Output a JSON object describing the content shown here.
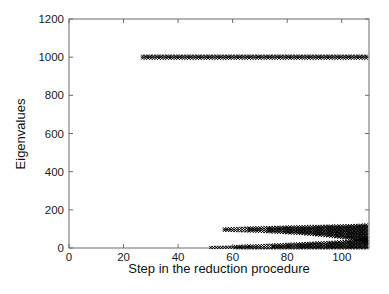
{
  "figure": {
    "background": "#ffffff",
    "frame_color": "#6b6b6b",
    "tick_label_color": "#1a1a1a",
    "marker_color": "#000000",
    "marker_glyph": "x"
  },
  "chart_data": {
    "type": "scatter",
    "title": "",
    "xlabel": "Step in the reduction procedure",
    "ylabel": "Eigenvalues",
    "xlim": [
      0,
      110
    ],
    "ylim": [
      0,
      1200
    ],
    "xticks": [
      0,
      20,
      40,
      60,
      80,
      100
    ],
    "yticks": [
      0,
      200,
      400,
      600,
      800,
      1000,
      1200
    ],
    "grid": false,
    "legend": null,
    "marker": "x",
    "series": [
      {
        "name": "cluster-near-1000",
        "step_start": 27,
        "step_end": 109,
        "band": [
          [
            27,
            995,
            1005
          ],
          [
            109,
            995,
            1005
          ]
        ]
      },
      {
        "name": "cluster-near-100",
        "step_start": 57,
        "step_end": 109,
        "band": [
          [
            57,
            93,
            100
          ],
          [
            70,
            88,
            106
          ],
          [
            85,
            76,
            111
          ],
          [
            95,
            64,
            114
          ],
          [
            103,
            50,
            117
          ],
          [
            107,
            40,
            119
          ],
          [
            109,
            25,
            121
          ]
        ]
      },
      {
        "name": "cluster-near-0",
        "step_start": 52,
        "step_end": 109,
        "band": [
          [
            52,
            1,
            4
          ],
          [
            70,
            1,
            12
          ],
          [
            85,
            1,
            22
          ],
          [
            97,
            1,
            30
          ],
          [
            103,
            1,
            36
          ],
          [
            107,
            1,
            42
          ],
          [
            109,
            1,
            52
          ]
        ]
      }
    ]
  }
}
